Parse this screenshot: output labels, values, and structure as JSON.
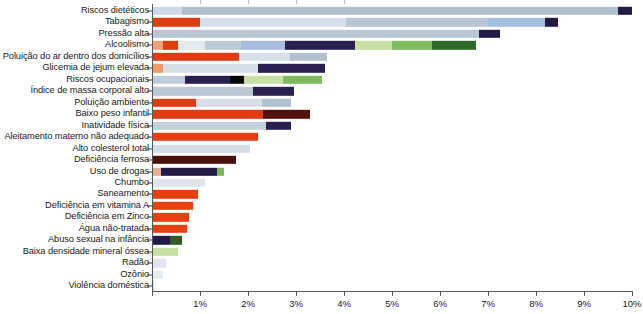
{
  "chart_data": {
    "type": "bar",
    "orientation": "horizontal",
    "stacked": true,
    "title": "",
    "subtitle": "",
    "xlabel": "",
    "ylabel": "",
    "xlim": [
      0,
      10
    ],
    "xunit": "%",
    "grid": false,
    "legend": "none",
    "xticks": [
      0,
      1,
      2,
      3,
      4,
      5,
      6,
      7,
      8,
      9,
      10
    ],
    "xtick_labels": [
      "",
      "1%",
      "2%",
      "3%",
      "4%",
      "5%",
      "6%",
      "7%",
      "8%",
      "9%",
      "10%"
    ],
    "categories": [
      "Riscos dietéticos",
      "Tabagismo",
      "Pressão alta",
      "Alcoolismo",
      "Poluição do ar dentro dos domicílios",
      "Glicemia de jejum elevada",
      "Riscos ocupacionais",
      "Índice de massa corporal alto",
      "Poluição ambiente",
      "Baixo peso infantil",
      "Inatividade física",
      "Aleitamento materno não adequado",
      "Alto colesterol total",
      "Deficiência ferrosa",
      "Uso de drogas",
      "Chumbo",
      "Saneamento",
      "Deficiência em vitamina A",
      "Deficiência em Zinco",
      "Água não-tratada",
      "Abuso sexual na infância",
      "Baixa densidade mineral óssea",
      "Radão",
      "Ozônio",
      "Violência doméstica"
    ],
    "values": [
      10.0,
      8.45,
      7.25,
      6.75,
      3.65,
      3.6,
      3.55,
      2.95,
      2.9,
      3.3,
      2.9,
      2.2,
      2.05,
      1.75,
      1.5,
      1.1,
      0.95,
      0.85,
      0.78,
      0.72,
      0.62,
      0.55,
      0.3,
      0.22,
      0.05
    ],
    "rows": [
      {
        "label": "Riscos dietéticos",
        "total": 10.0,
        "segments": [
          {
            "value": 0.62,
            "color": "#ccd8e6"
          },
          {
            "value": 9.08,
            "color": "#b1bfcb"
          },
          {
            "value": 0.3,
            "color": "#231b45"
          }
        ]
      },
      {
        "label": "Tabagismo",
        "total": 8.45,
        "segments": [
          {
            "value": 0.02,
            "color": "#f08a5a"
          },
          {
            "value": 0.98,
            "color": "#e03c12"
          },
          {
            "value": 3.05,
            "color": "#d5dfeb"
          },
          {
            "value": 2.95,
            "color": "#b8c6d3"
          },
          {
            "value": 1.18,
            "color": "#a4bede"
          },
          {
            "value": 0.27,
            "color": "#231b45"
          }
        ]
      },
      {
        "label": "Pressão alta",
        "total": 7.25,
        "segments": [
          {
            "value": 6.82,
            "color": "#b9c7d4"
          },
          {
            "value": 0.43,
            "color": "#231b45"
          }
        ]
      },
      {
        "label": "Alcoolismo",
        "total": 6.75,
        "segments": [
          {
            "value": 0.22,
            "color": "#f3a07b"
          },
          {
            "value": 0.33,
            "color": "#e03c12"
          },
          {
            "value": 0.55,
            "color": "#e3e9f1"
          },
          {
            "value": 0.75,
            "color": "#bcc9d6"
          },
          {
            "value": 0.93,
            "color": "#a7bcda"
          },
          {
            "value": 1.45,
            "color": "#2a2050"
          },
          {
            "value": 0.78,
            "color": "#c8dfa4"
          },
          {
            "value": 0.83,
            "color": "#7ebb5c"
          },
          {
            "value": 0.91,
            "color": "#2e6b2b"
          }
        ]
      },
      {
        "label": "Poluição do ar dentro dos domicílios",
        "total": 3.65,
        "segments": [
          {
            "value": 1.82,
            "color": "#e03c12"
          },
          {
            "value": 1.05,
            "color": "#d6dfe8"
          },
          {
            "value": 0.78,
            "color": "#b2c0cd"
          }
        ]
      },
      {
        "label": "Glicemia de jejum elevada",
        "total": 3.6,
        "segments": [
          {
            "value": 0.22,
            "color": "#f09963"
          },
          {
            "value": 1.98,
            "color": "#d6dfe8"
          },
          {
            "value": 1.4,
            "color": "#2a2050"
          }
        ]
      },
      {
        "label": "Riscos ocupacionais",
        "total": 3.55,
        "segments": [
          {
            "value": 0.68,
            "color": "#bfcbd6"
          },
          {
            "value": 0.95,
            "color": "#2a2050"
          },
          {
            "value": 0.28,
            "color": "#080808"
          },
          {
            "value": 0.82,
            "color": "#c8dfa4"
          },
          {
            "value": 0.82,
            "color": "#7ebb5c"
          }
        ]
      },
      {
        "label": "Índice de massa corporal alto",
        "total": 2.95,
        "segments": [
          {
            "value": 2.1,
            "color": "#b9c7d4"
          },
          {
            "value": 0.85,
            "color": "#2a2050"
          }
        ]
      },
      {
        "label": "Poluição ambiente",
        "total": 2.9,
        "segments": [
          {
            "value": 0.92,
            "color": "#e03c12"
          },
          {
            "value": 1.38,
            "color": "#d6dfe8"
          },
          {
            "value": 0.6,
            "color": "#b2c0cd"
          }
        ]
      },
      {
        "label": "Baixo peso infantil",
        "total": 3.3,
        "segments": [
          {
            "value": 2.32,
            "color": "#e03c12"
          },
          {
            "value": 0.98,
            "color": "#52110a"
          }
        ]
      },
      {
        "label": "Inatividade física",
        "total": 2.9,
        "segments": [
          {
            "value": 2.38,
            "color": "#c3cfd9"
          },
          {
            "value": 0.52,
            "color": "#2a2050"
          }
        ]
      },
      {
        "label": "Aleitamento materno não adequado",
        "total": 2.2,
        "segments": [
          {
            "value": 2.2,
            "color": "#e5400f"
          }
        ]
      },
      {
        "label": "Alto colesterol total",
        "total": 2.05,
        "segments": [
          {
            "value": 2.05,
            "color": "#d3dce7"
          }
        ]
      },
      {
        "label": "Deficiência ferrosa",
        "total": 1.75,
        "segments": [
          {
            "value": 1.75,
            "color": "#4a100a"
          }
        ]
      },
      {
        "label": "Uso de drogas",
        "total": 1.5,
        "segments": [
          {
            "value": 0.18,
            "color": "#e8b093"
          },
          {
            "value": 1.17,
            "color": "#231b45"
          },
          {
            "value": 0.15,
            "color": "#79b854"
          }
        ]
      },
      {
        "label": "Chumbo",
        "total": 1.1,
        "segments": [
          {
            "value": 1.1,
            "color": "#dde4ee"
          }
        ]
      },
      {
        "label": "Saneamento",
        "total": 0.95,
        "segments": [
          {
            "value": 0.95,
            "color": "#e5400f"
          }
        ]
      },
      {
        "label": "Deficiência em vitamina A",
        "total": 0.85,
        "segments": [
          {
            "value": 0.85,
            "color": "#e5400f"
          }
        ]
      },
      {
        "label": "Deficiência em Zinco",
        "total": 0.78,
        "segments": [
          {
            "value": 0.78,
            "color": "#e5400f"
          }
        ]
      },
      {
        "label": "Água não-tratada",
        "total": 0.72,
        "segments": [
          {
            "value": 0.72,
            "color": "#e5400f"
          }
        ]
      },
      {
        "label": "Abuso sexual na infância",
        "total": 0.62,
        "segments": [
          {
            "value": 0.37,
            "color": "#231b45"
          },
          {
            "value": 0.25,
            "color": "#2e5c24"
          }
        ]
      },
      {
        "label": "Baixa densidade mineral óssea",
        "total": 0.55,
        "segments": [
          {
            "value": 0.55,
            "color": "#c5e0a0"
          }
        ]
      },
      {
        "label": "Radão",
        "total": 0.3,
        "segments": [
          {
            "value": 0.3,
            "color": "#dfe6f0"
          }
        ]
      },
      {
        "label": "Ozônio",
        "total": 0.22,
        "segments": [
          {
            "value": 0.22,
            "color": "#e5ebf3"
          }
        ]
      },
      {
        "label": "Violência doméstica",
        "total": 0.05,
        "segments": [
          {
            "value": 0.05,
            "color": "#cfd8e4"
          }
        ]
      }
    ],
    "colors": {
      "red": "#e5400f",
      "dark_navy": "#231b45",
      "maroon": "#4a100a",
      "light_blue": "#d6dfe8",
      "grey_blue": "#b9c7d4",
      "medium_blue": "#a7bcda",
      "light_green": "#c8dfa4",
      "medium_green": "#7ebb5c",
      "dark_green": "#2e6b2b",
      "orange": "#f09963",
      "black": "#080808",
      "axis": "#55565a"
    }
  }
}
